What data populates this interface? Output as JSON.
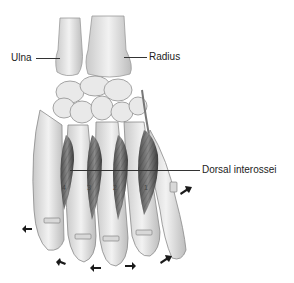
{
  "figure": {
    "labels": [
      {
        "id": "ulna",
        "text": "Ulna",
        "x": 11,
        "y": 52,
        "line_x1": 36,
        "line_x2": 60,
        "line_y": 58
      },
      {
        "id": "radius",
        "text": "Radius",
        "x": 149,
        "y": 51,
        "line_x1": 124,
        "line_x2": 147,
        "line_y": 57
      },
      {
        "id": "dorsal-interossei",
        "text": "Dorsal interossei",
        "x": 202,
        "y": 164,
        "line_x1": 70,
        "line_x2": 200,
        "line_y": 170
      }
    ],
    "muscle_numbers": [
      "4",
      "3",
      "2",
      "1"
    ],
    "arrows": [
      {
        "id": "arrow-thumb",
        "x": 184,
        "y": 188,
        "direction": "up-right"
      },
      {
        "id": "arrow-little-side",
        "x": 25,
        "y": 228,
        "direction": "left"
      },
      {
        "id": "arrow-ring",
        "x": 60,
        "y": 263,
        "direction": "left-up"
      },
      {
        "id": "arrow-middle-left",
        "x": 96,
        "y": 267,
        "direction": "left"
      },
      {
        "id": "arrow-middle-right",
        "x": 130,
        "y": 265,
        "direction": "right"
      },
      {
        "id": "arrow-index",
        "x": 163,
        "y": 257,
        "direction": "up-right"
      }
    ],
    "colors": {
      "bone": "#e6e6e6",
      "bone_shade": "#bdbdbd",
      "bone_outline": "#8a8a8a",
      "muscle": "#6f6f6f",
      "muscle_dark": "#3f3f3f",
      "text": "#222222",
      "arrow": "#1a1a1a"
    }
  }
}
